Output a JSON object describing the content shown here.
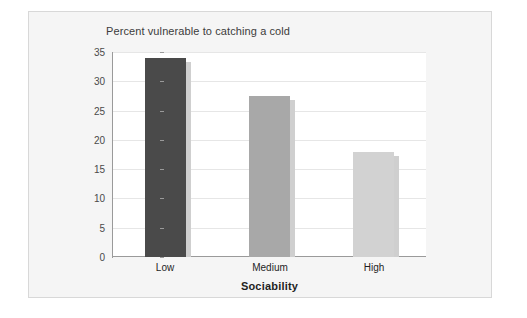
{
  "chart_data": {
    "type": "bar",
    "title": "Percent vulnerable to catching a cold",
    "xlabel": "Sociability",
    "ylabel": "",
    "categories": [
      "Low",
      "Medium",
      "High"
    ],
    "values": [
      34,
      27.5,
      18
    ],
    "ylim": [
      0,
      35
    ],
    "yticks": [
      0,
      5,
      10,
      15,
      20,
      25,
      30,
      35
    ],
    "ytick_labels": [
      "0",
      "5",
      "10",
      "15",
      "20",
      "25",
      "30",
      "35"
    ],
    "grid": true,
    "legend": "none",
    "bar_colors": [
      "#4a4a4a",
      "#a8a8a8",
      "#d2d2d2"
    ],
    "bar_shadow_color": "#cfcfcf",
    "gridline_color": "#e6e6e6",
    "axis_color": "#9a9a9a",
    "plot_background": "#ffffff",
    "panel_background": "#f5f5f5",
    "panel_border_color": "#d8d8d8",
    "title_color": "#3c3c3c",
    "tick_label_color": "#4a4a4a",
    "xlabel_color": "#1f1f1f"
  }
}
